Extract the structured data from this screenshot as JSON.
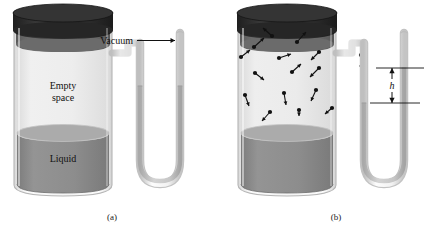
{
  "figure": {
    "type": "scientific-diagram",
    "background_color": "#ffffff"
  },
  "colors": {
    "cap_dark": "#2e2e2e",
    "cap_band": "#6e6e6e",
    "liquid": "#8c8c8c",
    "liquid_surface": "#a8a8a8",
    "vapor_space": "#eeeeee",
    "glass_outline": "#b9b9b9",
    "glass_fill": "#f6f6f6",
    "mercury": "#c9c9c9",
    "molecule": "#111111",
    "text": "#111111"
  },
  "panels": [
    {
      "id": "a",
      "caption": "(a)",
      "container": {
        "headspace_label_line1": "Empty",
        "headspace_label_line2": "space",
        "liquid_label": "Liquid",
        "has_molecules": false
      },
      "manometer": {
        "left_arm_level": "equal",
        "right_arm_level": "equal",
        "height_difference": 0,
        "annotation": {
          "label": "Vacuum",
          "arrow": "right-arrow",
          "points_to": "closed-right-tube"
        }
      }
    },
    {
      "id": "b",
      "caption": "(b)",
      "container": {
        "headspace_label_line1": "",
        "headspace_label_line2": "",
        "liquid_label": "Liquid",
        "has_molecules": true,
        "molecule_count": 16,
        "molecules": [
          {
            "x": 48,
            "y": 36,
            "dx": -9,
            "dy": -8
          },
          {
            "x": 30,
            "y": 47,
            "dx": 10,
            "dy": -9
          },
          {
            "x": 73,
            "y": 42,
            "dx": 9,
            "dy": -10
          },
          {
            "x": 17,
            "y": 57,
            "dx": 9,
            "dy": -7
          },
          {
            "x": 55,
            "y": 58,
            "dx": 12,
            "dy": -4
          },
          {
            "x": 95,
            "y": 52,
            "dx": -8,
            "dy": 8
          },
          {
            "x": 31,
            "y": 73,
            "dx": 9,
            "dy": 7
          },
          {
            "x": 68,
            "y": 72,
            "dx": 9,
            "dy": -8
          },
          {
            "x": 95,
            "y": 68,
            "dx": -9,
            "dy": 9
          },
          {
            "x": 21,
            "y": 95,
            "dx": 4,
            "dy": 11
          },
          {
            "x": 60,
            "y": 93,
            "dx": 2,
            "dy": 12
          },
          {
            "x": 92,
            "y": 90,
            "dx": -5,
            "dy": 11
          },
          {
            "x": 46,
            "y": 112,
            "dx": -8,
            "dy": 9
          },
          {
            "x": 75,
            "y": 110,
            "dx": 0,
            "dy": 6
          },
          {
            "x": 108,
            "y": 108,
            "dx": -7,
            "dy": 6
          },
          {
            "x": 137,
            "y": 55,
            "dx": 0,
            "dy": 14
          }
        ]
      },
      "manometer": {
        "left_arm_level": "depressed",
        "right_arm_level": "raised",
        "annotation": {
          "label": "h",
          "label_style": "italic",
          "arrow": "double-headed-vertical",
          "meaning": "height difference equals vapor pressure"
        }
      }
    }
  ]
}
